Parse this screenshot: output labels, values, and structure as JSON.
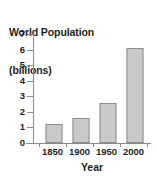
{
  "chart_data": {
    "type": "bar",
    "title": "World Population (billions)",
    "title_lines": [
      "World Population",
      "(billions)"
    ],
    "categories": [
      "1850",
      "1900",
      "1950",
      "2000"
    ],
    "values": [
      1.2,
      1.6,
      2.6,
      6.1
    ],
    "series": [
      {
        "name": "World Population",
        "values": [
          1.2,
          1.6,
          2.6,
          6.1
        ]
      }
    ],
    "xlabel": "Year",
    "ylabel": "World Population (billions)",
    "ylim": [
      0,
      7
    ],
    "yticks": [
      "0",
      "1",
      "2",
      "3",
      "4",
      "5",
      "6",
      "7"
    ],
    "ytick_values": [
      0,
      1,
      2,
      3,
      4,
      5,
      6,
      7
    ],
    "xticks": [
      "1850",
      "1900",
      "1950",
      "2000"
    ],
    "grid": false,
    "legend": false,
    "legend_position": "none",
    "bar_fill_color": "#c9c9c9",
    "bar_border_color": "#8e8e8e",
    "axis_color": "#8b8b8b",
    "text_color": "#231f20",
    "background_color": "#ffffff"
  }
}
